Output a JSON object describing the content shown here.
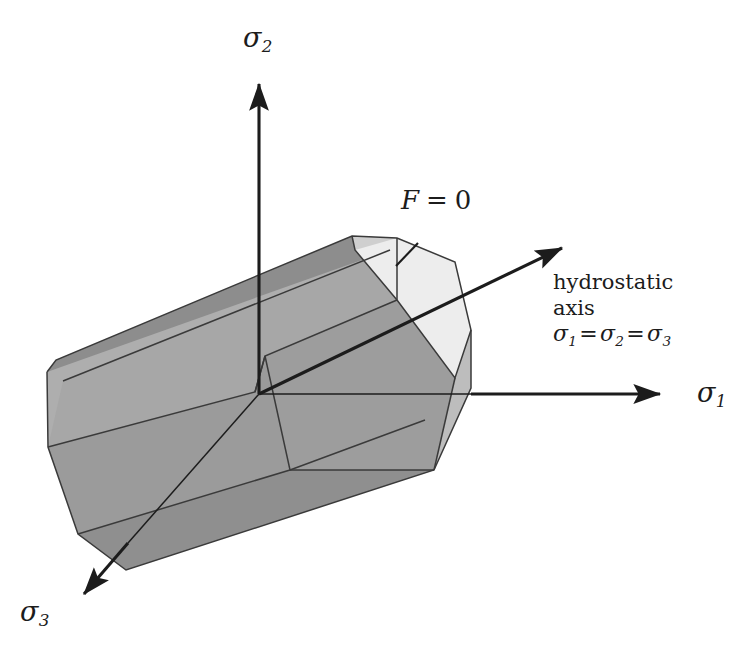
{
  "figure": {
    "background_color": "#ffffff",
    "line_color": "#1c1c1c",
    "width": 756,
    "height": 658
  },
  "axes": [
    {
      "name": "sigma-2-axis",
      "label_symbol": "σ",
      "label_subscript": "2",
      "direction": "up",
      "origin": [
        259,
        394
      ],
      "tip": [
        259,
        73
      ]
    },
    {
      "name": "sigma-1-axis",
      "label_symbol": "σ",
      "label_subscript": "1",
      "direction": "right",
      "origin": [
        259,
        394
      ],
      "tip": [
        672,
        394
      ]
    },
    {
      "name": "sigma-3-axis",
      "label_symbol": "σ",
      "label_subscript": "3",
      "direction": "down-left",
      "origin": [
        259,
        394
      ],
      "tip": [
        74,
        604
      ]
    }
  ],
  "hydrostatic_axis": {
    "name": "hydrostatic-axis",
    "origin": [
      259,
      394
    ],
    "tip": [
      572,
      242
    ],
    "annotation_line_1": "hydrostatic",
    "annotation_line_2": "axis",
    "equation_symbol": "σ",
    "equation": "σ₁ = σ₂ = σ₃",
    "equation_parts": {
      "term1_sub": "1",
      "term2_sub": "2",
      "term3_sub": "3",
      "operator": "="
    }
  },
  "surface_label": {
    "name": "yield-function-label",
    "function_symbol": "F",
    "operator": "=",
    "value": "0",
    "full_text": "F = 0",
    "leader_from": [
      418,
      243
    ],
    "leader_to": [
      396,
      266
    ]
  },
  "prism": {
    "description": "Hexagonal prism yield surface aligned with the hydrostatic axis",
    "faces": [
      {
        "name": "end-cap-hexagon",
        "color": "#ececec",
        "shade": "lightest"
      },
      {
        "name": "upper-right-face",
        "color": "#d2d2d2",
        "shade": "light"
      },
      {
        "name": "top-face",
        "color": "#a9a9a9",
        "shade": "medium"
      },
      {
        "name": "upper-left-face",
        "color": "#b0b0b0",
        "shade": "medium-light"
      },
      {
        "name": "lower-left-face",
        "color": "#9a9a9a",
        "shade": "dark"
      },
      {
        "name": "bottom-face",
        "color": "#8f8f8f",
        "shade": "darkest"
      },
      {
        "name": "lower-right-face",
        "color": "#9e9e9e",
        "shade": "dark"
      },
      {
        "name": "top-edge-band",
        "color": "#8a8a8a",
        "shade": "edge"
      }
    ],
    "edge_color": "#3a3a3a",
    "edge_width": 1.4
  },
  "colors": {
    "ink": "#1c1c1c",
    "edge": "#3a3a3a",
    "background": "#ffffff"
  }
}
